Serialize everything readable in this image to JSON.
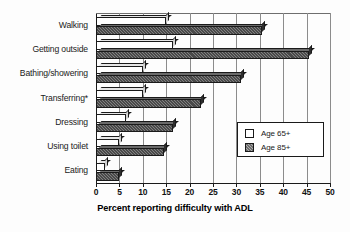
{
  "chart_data": {
    "type": "bar",
    "orientation": "horizontal",
    "title": "",
    "xlabel": "Percent reporting difficulty with ADL",
    "ylabel": "",
    "xlim": [
      0,
      50
    ],
    "xticks": [
      0,
      5,
      10,
      15,
      20,
      25,
      30,
      35,
      40,
      45,
      50
    ],
    "grid": true,
    "legend_position": "center-right",
    "categories": [
      "Walking",
      "Getting outside",
      "Bathing/showering",
      "Transferring*",
      "Dressing",
      "Using toilet",
      "Eating"
    ],
    "series": [
      {
        "name": "Age 65+",
        "style": "white",
        "values": [
          15,
          16.5,
          10,
          10,
          6.5,
          5,
          2
        ]
      },
      {
        "name": "Age 85+",
        "style": "hatched-gray",
        "values": [
          35.5,
          45.5,
          31,
          22.5,
          16.5,
          14.5,
          5
        ]
      }
    ],
    "footnote_marker": "*"
  },
  "legend": {
    "items": [
      {
        "label": "Age 65+",
        "swatch": "white-square"
      },
      {
        "label": "Age 85+",
        "swatch": "hatched-square"
      }
    ]
  },
  "colors": {
    "axis": "#1a1a1a",
    "gridline": "#8c8c8c",
    "series_65_fill": "#ffffff",
    "series_85_fill": "#4a4a4a",
    "background": "#fdfdfd"
  }
}
